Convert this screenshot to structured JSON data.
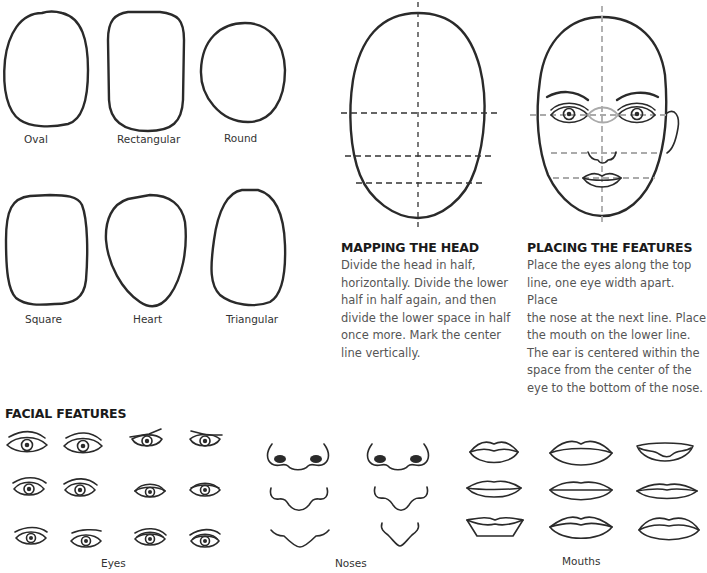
{
  "face_shapes": {
    "items": [
      {
        "label": "Oval"
      },
      {
        "label": "Rectangular"
      },
      {
        "label": "Round"
      },
      {
        "label": "Square"
      },
      {
        "label": "Heart"
      },
      {
        "label": "Triangular"
      }
    ]
  },
  "mapping": {
    "title": "MAPPING THE HEAD",
    "lines": [
      "Divide the head in half,",
      "horizontally. Divide the lower",
      "half in half again, and then",
      "divide the lower space in half",
      "once more. Mark the center",
      "line vertically."
    ]
  },
  "placing": {
    "title": "PLACING THE FEATURES",
    "lines": [
      "Place the eyes along the top",
      "line, one eye width apart. Place",
      "the nose at the next line. Place",
      "the mouth on the lower line.",
      "The ear is centered within the",
      "space from the center of the",
      "eye to the bottom of the nose."
    ]
  },
  "features": {
    "title": "FACIAL FEATURES",
    "eyes_label": "Eyes",
    "noses_label": "Noses",
    "mouths_label": "Mouths"
  },
  "colors": {
    "line": "#2a2a2a",
    "guide_gray": "#aaaaaa",
    "body_text": "#555555"
  }
}
